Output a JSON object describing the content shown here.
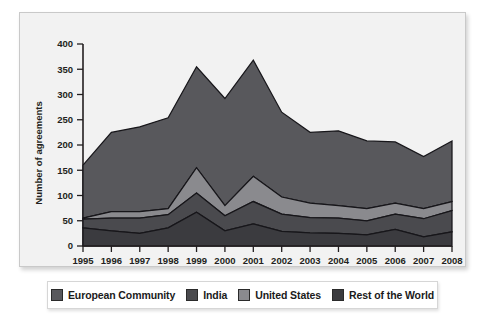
{
  "chart_data": {
    "type": "area",
    "stacked": true,
    "title": "",
    "xlabel": "",
    "ylabel": "Number of agreements",
    "ylim": [
      0,
      400
    ],
    "ytick_step": 50,
    "yticks": [
      0,
      50,
      100,
      150,
      200,
      250,
      300,
      350,
      400
    ],
    "grid": false,
    "legend_position": "bottom",
    "categories": [
      "1995",
      "1996",
      "1997",
      "1998",
      "1999",
      "2000",
      "2001",
      "2002",
      "2003",
      "2004",
      "2005",
      "2006",
      "2007",
      "2008"
    ],
    "x": [
      1995,
      1996,
      1997,
      1998,
      1999,
      2000,
      2001,
      2002,
      2003,
      2004,
      2005,
      2006,
      2007,
      2008
    ],
    "series": [
      {
        "name": "Rest of the World",
        "color": "#3b3b3f",
        "order": 1,
        "values": [
          36,
          30,
          25,
          36,
          67,
          30,
          44,
          29,
          26,
          25,
          22,
          33,
          18,
          28
        ]
      },
      {
        "name": "United States",
        "color": "#4a4a4e",
        "order": 2,
        "values": [
          17,
          25,
          30,
          26,
          38,
          30,
          44,
          34,
          30,
          30,
          28,
          30,
          36,
          42
        ]
      },
      {
        "name": "India",
        "color": "#8a8a8e",
        "order": 3,
        "values": [
          2,
          13,
          13,
          12,
          50,
          20,
          50,
          34,
          29,
          25,
          24,
          22,
          20,
          18
        ]
      },
      {
        "name": "European Community",
        "color": "#58585c",
        "order": 4,
        "values": [
          105,
          157,
          168,
          180,
          200,
          212,
          230,
          168,
          140,
          148,
          134,
          121,
          103,
          120
        ]
      }
    ],
    "totals": [
      160,
      225,
      236,
      254,
      355,
      292,
      368,
      265,
      225,
      228,
      208,
      206,
      177,
      208
    ],
    "cumulative": {
      "rest_of_the_world_top": [
        36,
        30,
        25,
        36,
        67,
        30,
        44,
        29,
        26,
        25,
        22,
        33,
        18,
        28
      ],
      "united_states_top": [
        53,
        55,
        55,
        62,
        105,
        60,
        88,
        63,
        56,
        55,
        50,
        63,
        54,
        70
      ],
      "india_top": [
        55,
        68,
        68,
        74,
        155,
        80,
        138,
        97,
        85,
        80,
        74,
        85,
        74,
        88
      ],
      "european_community_top": [
        160,
        225,
        236,
        254,
        355,
        292,
        368,
        265,
        225,
        228,
        208,
        206,
        177,
        208
      ]
    }
  },
  "legend": {
    "items": [
      {
        "label": "European Community",
        "color": "#58585c"
      },
      {
        "label": "India",
        "color": "#4a4a4e"
      },
      {
        "label": "United States",
        "color": "#8a8a8e"
      },
      {
        "label": "Rest of the World",
        "color": "#3b3b3f"
      }
    ]
  },
  "axes": {
    "ylabel": "Number of agreements",
    "yticks": [
      "400",
      "350",
      "300",
      "250",
      "200",
      "150",
      "100",
      "50",
      "0"
    ],
    "xticks": [
      "1995",
      "1996",
      "1997",
      "1998",
      "1999",
      "2000",
      "2001",
      "2002",
      "2003",
      "2004",
      "2005",
      "2006",
      "2007",
      "2008"
    ]
  },
  "colors": {
    "panel_background": "#f2f2f2",
    "page_background": "#ffffff",
    "axis": "#231f20",
    "series_outline": "#17161a"
  }
}
